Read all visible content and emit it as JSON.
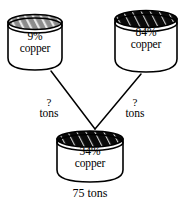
{
  "diagram": {
    "type": "mixture-problem-flow-diagram",
    "source_vats": [
      {
        "id": "left",
        "percent": "9%",
        "material": "copper",
        "top_fill": "#8c8c8c",
        "hatch": "white-diagonal"
      },
      {
        "id": "right",
        "percent": "84%",
        "material": "copper",
        "top_fill": "#0a0a0a",
        "hatch": "white-diagonal"
      }
    ],
    "flows": [
      {
        "id": "left-flow",
        "quantity": "?",
        "unit": "tons"
      },
      {
        "id": "right-flow",
        "quantity": "?",
        "unit": "tons"
      }
    ],
    "result_vat": {
      "id": "mixture",
      "percent": "34%",
      "material": "copper",
      "total": "75  tons",
      "top_fill": "#0a0a0a",
      "hatch": "white-diagonal"
    },
    "colors": {
      "stroke": "#000000",
      "body_fill": "#ffffff",
      "background": "#ffffff"
    }
  }
}
